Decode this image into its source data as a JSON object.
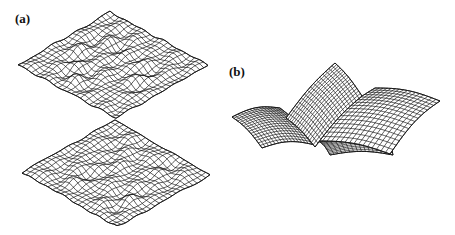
{
  "figure": {
    "panels": [
      {
        "label": "(a)",
        "description": "Two 3D wireframe random rough surfaces (top and bottom), viewed obliquely as diamond-shaped meshes",
        "surfaces": [
          {
            "name": "upper-rough-surface",
            "top": [
              110,
              12
            ],
            "left": [
              18,
              65
            ],
            "right": [
              208,
              65
            ],
            "bottom": [
              115,
              118
            ]
          },
          {
            "name": "lower-rough-surface",
            "top": [
              115,
              120
            ],
            "left": [
              22,
              172
            ],
            "right": [
              210,
              175
            ],
            "bottom": [
              115,
              225
            ]
          }
        ],
        "grid_lines": 22,
        "roughness_amplitude": 6
      },
      {
        "label": "(b)",
        "description": "3D wireframe of four curved leaf-like surface patches meeting at a central point",
        "grid_lines": 16
      }
    ],
    "colors": {
      "line": "#1a1a1a",
      "background": "#ffffff"
    }
  }
}
